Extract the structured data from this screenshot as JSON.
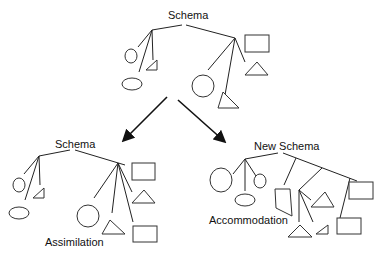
{
  "diagram": {
    "top": {
      "title": "Schema"
    },
    "left": {
      "title": "Schema",
      "process": "Assimilation"
    },
    "right": {
      "title": "New Schema",
      "process": "Accommodation"
    }
  }
}
